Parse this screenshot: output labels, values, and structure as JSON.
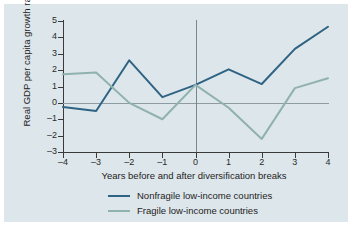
{
  "figure": {
    "background_color": "#dde6ea",
    "axis_color": "#3a3a3a",
    "zero_line_color": "#8e9ba2"
  },
  "chart_data": {
    "type": "line",
    "title": "",
    "xlabel": "Years before and after diversification breaks",
    "ylabel": "Real GDP per capita growth rates",
    "x": [
      -4,
      -3,
      -2,
      -1,
      0,
      1,
      2,
      3,
      4
    ],
    "xtick_labels": [
      "–4",
      "–3",
      "–2",
      "–1",
      "0",
      "1",
      "2",
      "3",
      "4"
    ],
    "ytick_labels": [
      "5",
      "4",
      "3",
      "2",
      "1",
      "0",
      "–1",
      "–2",
      "–3"
    ],
    "ytick_values": [
      5,
      4,
      3,
      2,
      1,
      0,
      -1,
      -2,
      -3
    ],
    "xlim": [
      -4,
      4
    ],
    "ylim": [
      -3,
      5
    ],
    "grid": false,
    "zero_reference_lines": [
      "y=0",
      "x=0"
    ],
    "legend_position": "bottom-center",
    "series": [
      {
        "name": "Nonfragile low-income countries",
        "color": "#2f6384",
        "values": [
          -0.25,
          -0.5,
          2.6,
          0.35,
          1.1,
          2.05,
          1.15,
          3.3,
          4.65
        ]
      },
      {
        "name": "Fragile low-income countries",
        "color": "#8fb2ae",
        "values": [
          1.75,
          1.85,
          0.0,
          -1.0,
          1.1,
          -0.3,
          -2.2,
          0.9,
          1.5
        ]
      }
    ]
  },
  "legend": {
    "items": [
      {
        "label": "Nonfragile low-income countries",
        "color": "#2f6384"
      },
      {
        "label": "Fragile low-income countries",
        "color": "#8fb2ae"
      }
    ]
  }
}
